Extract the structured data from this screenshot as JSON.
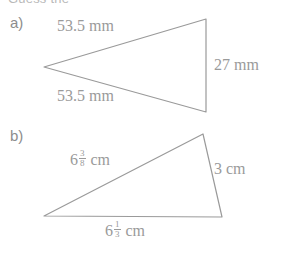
{
  "page": {
    "clipped_heading": "Guess the",
    "background_color": "#ffffff",
    "stroke_color": "#9a9a9a",
    "text_color": "#9a9a9a",
    "label_color": "#8d8d8d"
  },
  "figures": [
    {
      "id": "a",
      "label": "a)",
      "shape": "triangle",
      "vertices": [
        [
          44,
          67
        ],
        [
          206,
          19
        ],
        [
          206,
          112
        ]
      ],
      "dimensions": [
        {
          "name": "upper-side",
          "text": "53.5 mm",
          "value": "53.5",
          "unit": "mm"
        },
        {
          "name": "lower-side",
          "text": "53.5 mm",
          "value": "53.5",
          "unit": "mm"
        },
        {
          "name": "right-side",
          "text": "27 mm",
          "value": "27",
          "unit": "mm"
        }
      ]
    },
    {
      "id": "b",
      "label": "b)",
      "shape": "triangle",
      "vertices": [
        [
          44,
          216
        ],
        [
          203,
          134
        ],
        [
          222,
          217
        ]
      ],
      "dimensions": [
        {
          "name": "upper-side",
          "whole": "6",
          "numerator": "3",
          "denominator": "8",
          "unit": "cm",
          "text": "6 3/8 cm"
        },
        {
          "name": "right-side",
          "text": "3 cm",
          "value": "3",
          "unit": "cm"
        },
        {
          "name": "bottom-side",
          "whole": "6",
          "numerator": "1",
          "denominator": "3",
          "unit": "cm",
          "text": "6 1/3 cm"
        }
      ]
    }
  ]
}
